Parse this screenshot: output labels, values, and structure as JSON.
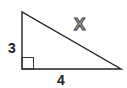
{
  "diagram": {
    "type": "right-triangle",
    "sides": {
      "vertical_leg": {
        "label": "3"
      },
      "horizontal_leg": {
        "label": "4"
      },
      "hypotenuse": {
        "label": "X"
      }
    },
    "right_angle_marker": true,
    "colors": {
      "stroke": "#222222",
      "label": "#222222",
      "x_fill": "#a8a8a8",
      "x_outline": "#444444",
      "background": "#ffffff"
    }
  }
}
